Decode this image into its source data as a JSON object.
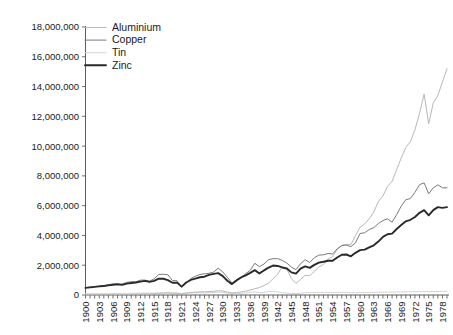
{
  "chart_data": {
    "type": "line",
    "title": "",
    "subtitle": "",
    "xlabel": "",
    "ylabel": "",
    "xlim": [
      1900,
      1979
    ],
    "ylim": [
      0,
      18000000
    ],
    "ytick_step": 2000000,
    "xtick_label_step": 3,
    "grid": false,
    "legend_position": "top-left",
    "ytick_labels": [
      "18,000,000",
      "16,000,000",
      "14,000,000",
      "12,000,000",
      "10,000,000",
      "8,000,000",
      "6,000,000",
      "4,000,000",
      "2,000,000",
      "0"
    ],
    "ytick_values": [
      18000000,
      16000000,
      14000000,
      12000000,
      10000000,
      8000000,
      6000000,
      4000000,
      2000000,
      0
    ],
    "xtick_labels": [
      "1900",
      "1903",
      "1906",
      "1909",
      "1912",
      "1915",
      "1918",
      "1921",
      "1924",
      "1927",
      "1930",
      "1933",
      "1936",
      "1939",
      "1942",
      "1945",
      "1948",
      "1951",
      "1954",
      "1957",
      "1960",
      "1963",
      "1966",
      "1969",
      "1972",
      "1975",
      "1978"
    ],
    "x": [
      1900,
      1901,
      1902,
      1903,
      1904,
      1905,
      1906,
      1907,
      1908,
      1909,
      1910,
      1911,
      1912,
      1913,
      1914,
      1915,
      1916,
      1917,
      1918,
      1919,
      1920,
      1921,
      1922,
      1923,
      1924,
      1925,
      1926,
      1927,
      1928,
      1929,
      1930,
      1931,
      1932,
      1933,
      1934,
      1935,
      1936,
      1937,
      1938,
      1939,
      1940,
      1941,
      1942,
      1943,
      1944,
      1945,
      1946,
      1947,
      1948,
      1949,
      1950,
      1951,
      1952,
      1953,
      1954,
      1955,
      1956,
      1957,
      1958,
      1959,
      1960,
      1961,
      1962,
      1963,
      1964,
      1965,
      1966,
      1967,
      1968,
      1969,
      1970,
      1971,
      1972,
      1973,
      1974,
      1975,
      1976,
      1977,
      1978,
      1979
    ],
    "series": [
      {
        "name": "Aluminium",
        "color": "#b8b8b8",
        "width": 1.0,
        "values": [
          7000,
          8000,
          9000,
          11000,
          13000,
          15000,
          18000,
          22000,
          20000,
          27000,
          45000,
          55000,
          65000,
          70000,
          72000,
          90000,
          120000,
          140000,
          150000,
          130000,
          125000,
          80000,
          130000,
          175000,
          190000,
          210000,
          215000,
          225000,
          250000,
          285000,
          265000,
          195000,
          140000,
          165000,
          205000,
          260000,
          330000,
          420000,
          500000,
          630000,
          790000,
          1100000,
          1400000,
          1900000,
          1750000,
          1100000,
          780000,
          1050000,
          1320000,
          1300000,
          1580000,
          1880000,
          2050000,
          2420000,
          2570000,
          3070000,
          3330000,
          3410000,
          3390000,
          3980000,
          4550000,
          4770000,
          5120000,
          5570000,
          6280000,
          6650000,
          7300000,
          7640000,
          8420000,
          9200000,
          9900000,
          10300000,
          11100000,
          12200000,
          13500000,
          11500000,
          12900000,
          13400000,
          14300000,
          15200000
        ]
      },
      {
        "name": "Copper",
        "color": "#7a7a7a",
        "width": 1.0,
        "values": [
          495000,
          525000,
          560000,
          600000,
          640000,
          700000,
          740000,
          720000,
          730000,
          850000,
          890000,
          890000,
          1000000,
          1000000,
          930000,
          1090000,
          1380000,
          1390000,
          1360000,
          970000,
          960000,
          530000,
          790000,
          1100000,
          1260000,
          1380000,
          1420000,
          1460000,
          1540000,
          1800000,
          1550000,
          1190000,
          810000,
          1020000,
          1180000,
          1430000,
          1660000,
          2130000,
          1900000,
          2080000,
          2370000,
          2440000,
          2440000,
          2320000,
          2150000,
          1870000,
          1700000,
          2110000,
          2370000,
          2180000,
          2500000,
          2680000,
          2700000,
          2790000,
          2750000,
          3100000,
          3320000,
          3350000,
          3250000,
          3500000,
          4130000,
          4180000,
          4400000,
          4520000,
          4800000,
          5000000,
          5120000,
          4890000,
          5400000,
          5970000,
          6400000,
          6480000,
          6900000,
          7410000,
          7530000,
          6800000,
          7200000,
          7400000,
          7200000,
          7200000
        ]
      },
      {
        "name": "Tin",
        "color": "#d4d4d4",
        "width": 1.0,
        "values": [
          85000,
          88000,
          92000,
          94000,
          92000,
          95000,
          98000,
          100000,
          102000,
          105000,
          110000,
          115000,
          122000,
          130000,
          120000,
          128000,
          130000,
          128000,
          125000,
          115000,
          120000,
          96000,
          125000,
          135000,
          142000,
          148000,
          145000,
          155000,
          170000,
          195000,
          175000,
          130000,
          95000,
          90000,
          110000,
          140000,
          180000,
          210000,
          155000,
          170000,
          235000,
          245000,
          205000,
          155000,
          130000,
          110000,
          100000,
          115000,
          155000,
          165000,
          170000,
          180000,
          175000,
          175000,
          170000,
          175000,
          180000,
          175000,
          150000,
          155000,
          165000,
          170000,
          175000,
          180000,
          185000,
          190000,
          195000,
          195000,
          200000,
          205000,
          215000,
          220000,
          225000,
          230000,
          235000,
          225000,
          230000,
          235000,
          240000,
          245000
        ]
      },
      {
        "name": "Zinc",
        "color": "#2a2a2a",
        "width": 1.9,
        "values": [
          480000,
          510000,
          545000,
          580000,
          600000,
          650000,
          690000,
          720000,
          680000,
          760000,
          810000,
          840000,
          900000,
          950000,
          880000,
          950000,
          1100000,
          1090000,
          1000000,
          820000,
          830000,
          560000,
          840000,
          1010000,
          1100000,
          1190000,
          1230000,
          1350000,
          1420000,
          1470000,
          1270000,
          960000,
          730000,
          980000,
          1180000,
          1320000,
          1490000,
          1670000,
          1450000,
          1650000,
          1840000,
          1980000,
          1950000,
          1850000,
          1780000,
          1520000,
          1430000,
          1770000,
          1920000,
          1820000,
          2020000,
          2170000,
          2230000,
          2300000,
          2300000,
          2520000,
          2700000,
          2720000,
          2600000,
          2830000,
          3010000,
          3050000,
          3200000,
          3340000,
          3590000,
          3900000,
          4080000,
          4120000,
          4430000,
          4700000,
          4950000,
          5050000,
          5240000,
          5520000,
          5700000,
          5350000,
          5700000,
          5900000,
          5850000,
          5900000
        ]
      }
    ]
  },
  "legend": {
    "items": [
      {
        "label": "Aluminium"
      },
      {
        "label": "Copper"
      },
      {
        "label": "Tin"
      },
      {
        "label": "Zinc"
      }
    ]
  }
}
